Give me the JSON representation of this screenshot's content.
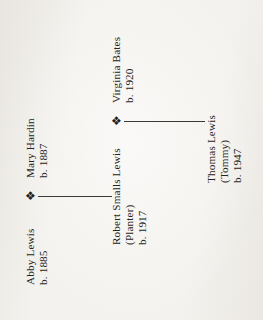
{
  "document": {
    "type": "genealogy-chart",
    "orientation": "rotated-90-ccw",
    "background_color": "#f4f2ee",
    "ink_color": "#232320"
  },
  "symbols": {
    "marriage_glyph": "❖",
    "marriage_icon_name": "marriage-diamond-icon"
  },
  "generations": [
    {
      "id": "gen1",
      "couple": [
        {
          "name": "Abby Lewis",
          "subtitle": "",
          "birth": "b. 1885"
        },
        {
          "name": "Mary Hardin",
          "subtitle": "",
          "birth": "b. 1887"
        }
      ]
    },
    {
      "id": "gen2",
      "couple": [
        {
          "name": "Robert Smalls Lewis",
          "subtitle": "(Planter)",
          "birth": "b. 1917"
        },
        {
          "name": "Virginia Bates",
          "subtitle": "",
          "birth": "b. 1920"
        }
      ]
    },
    {
      "id": "gen3",
      "couple": [
        {
          "name": "Thomas Lewis",
          "subtitle": "(Tommy)",
          "birth": "b. 1947"
        }
      ]
    }
  ],
  "people": {
    "abby_lewis": {
      "name": "Abby Lewis",
      "birth": "b. 1885"
    },
    "mary_hardin": {
      "name": "Mary Hardin",
      "birth": "b. 1887"
    },
    "robert_smalls_lewis": {
      "name": "Robert Smalls Lewis",
      "occupation": "(Planter)",
      "birth": "b. 1917"
    },
    "virginia_bates": {
      "name": "Virginia Bates",
      "birth": "b. 1920"
    },
    "thomas_lewis": {
      "name": "Thomas Lewis",
      "nickname": "(Tommy)",
      "birth": "b. 1947"
    }
  },
  "connectors": [
    {
      "id": "line-gen1-to-gen2",
      "from": "abby-mary-union",
      "to": "robert-smalls-lewis"
    },
    {
      "id": "line-gen2-to-gen3",
      "from": "robert-virginia-union",
      "to": "thomas-lewis"
    }
  ]
}
